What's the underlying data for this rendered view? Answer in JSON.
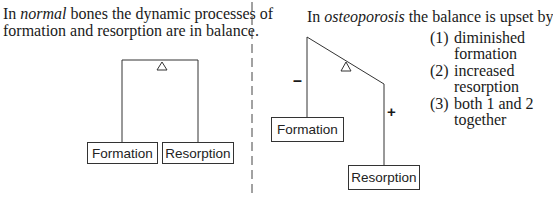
{
  "left_panel": {
    "caption_line1_prefix": "In ",
    "caption_line1_italic": "normal",
    "caption_line1_suffix": " bones the dynamic processes of",
    "caption_line2": "formation and resorption are in balance.",
    "boxes": {
      "formation": "Formation",
      "resorption": "Resorption"
    }
  },
  "right_panel": {
    "caption_prefix": "In ",
    "caption_italic": "osteoporosis",
    "caption_suffix": " the balance is upset by",
    "boxes": {
      "formation": "Formation",
      "resorption": "Resorption"
    },
    "signs": {
      "formation": "–",
      "resorption": "+"
    },
    "list": [
      {
        "num": "(1)",
        "line1": "diminished",
        "line2": "formation"
      },
      {
        "num": "(2)",
        "line1": "increased",
        "line2": "resorption"
      },
      {
        "num": "(3)",
        "line1": "both 1 and 2",
        "line2": "together"
      }
    ]
  },
  "colors": {
    "line": "#333333",
    "text": "#1a1a1a"
  }
}
